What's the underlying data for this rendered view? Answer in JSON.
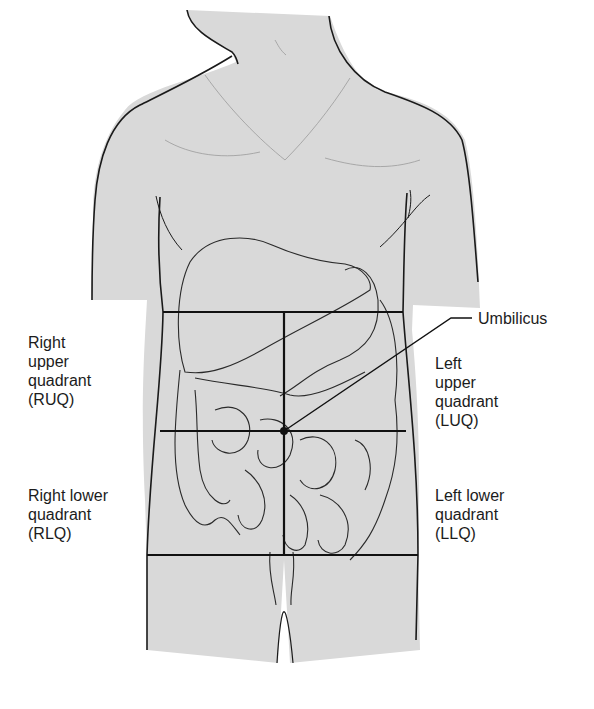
{
  "figure": {
    "colors": {
      "skin": "#d9d9d9",
      "outline": "#1a1a1a",
      "organ_line": "#2a2a2a",
      "background": "#ffffff"
    }
  },
  "labels": {
    "umbilicus": "Umbilicus",
    "ruq": {
      "line1": "Right",
      "line2": "upper",
      "line3": "quadrant",
      "line4": "(RUQ)"
    },
    "rlq": {
      "line1": "Right lower",
      "line2": "quadrant",
      "line3": "(RLQ)"
    },
    "luq": {
      "line1": "Left",
      "line2": "upper",
      "line3": "quadrant",
      "line4": "(LUQ)"
    },
    "llq": {
      "line1": "Left lower",
      "line2": "quadrant",
      "line3": "(LLQ)"
    }
  }
}
